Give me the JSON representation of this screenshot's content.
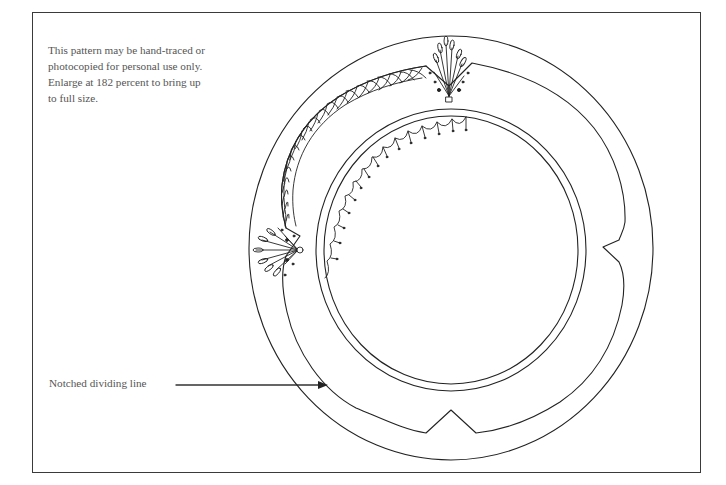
{
  "instructions": {
    "lines": [
      "This pattern may be hand-traced or",
      "photocopied for personal use only.",
      "Enlarge at 182 percent to bring up",
      "to full size."
    ],
    "enlarge_percent": 182
  },
  "callout": {
    "label": "Notched dividing line"
  },
  "pattern": {
    "shapes": [
      "outer-circle",
      "notched-dividing-line",
      "inner-ring-outer-edge",
      "inner-ring-inner-edge"
    ],
    "ornaments": [
      "top-fan-ornament",
      "left-fan-ornament",
      "scalloped-cross-band",
      "inner-scallop-tassel-band"
    ],
    "notches": [
      "top",
      "right",
      "bottom",
      "left"
    ],
    "line_color": "#222222"
  }
}
